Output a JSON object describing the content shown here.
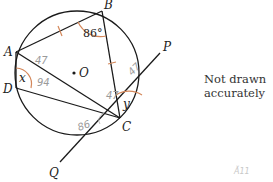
{
  "diagram": {
    "points": {
      "A": {
        "label": "A",
        "x": 16,
        "y": 52
      },
      "B": {
        "label": "B",
        "x": 102,
        "y": 11
      },
      "C": {
        "label": "C",
        "x": 120,
        "y": 118
      },
      "D": {
        "label": "D",
        "x": 16,
        "y": 88
      },
      "O": {
        "label": "O",
        "x": 77,
        "y": 73
      },
      "P": {
        "label": "P",
        "x": 160,
        "y": 53
      },
      "Q": {
        "label": "Q",
        "x": 60,
        "y": 162
      }
    },
    "angles": {
      "B": "86°",
      "x": "x",
      "y": "y"
    },
    "handwritten": {
      "angle_A_top": "47",
      "angle_x_mark": "94",
      "angle_C_inner": "47",
      "angle_tangent_P": "47",
      "angle_tangent_Q": "86",
      "bottom_right": "Ă11"
    },
    "note": "Not drawn accurately",
    "colors": {
      "lines": "#1a1a1a",
      "arcs": "#d4875a",
      "handwriting": "#9a9a9a"
    }
  }
}
